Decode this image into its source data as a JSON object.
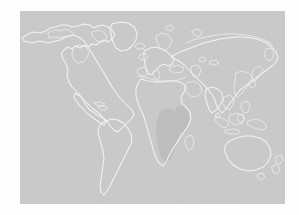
{
  "page": {
    "background_color": "#fdfdfd"
  },
  "figure": {
    "name": "world-map",
    "type": "world-map-graphic",
    "caption": "",
    "ocean_color": "#c9c9c9",
    "coastline_color": "#f2f2f2",
    "highlight_color": "#bdbdbd",
    "panel": {
      "left": 20,
      "top": 11,
      "width": 265,
      "height": 193
    },
    "projection": "equirectangular",
    "landmasses": [
      {
        "name": "north-america",
        "label": "North America"
      },
      {
        "name": "greenland",
        "label": "Greenland"
      },
      {
        "name": "south-america",
        "label": "South America"
      },
      {
        "name": "europe",
        "label": "Europe"
      },
      {
        "name": "africa",
        "label": "Africa"
      },
      {
        "name": "asia",
        "label": "Asia"
      },
      {
        "name": "southeast-asia-islands",
        "label": "Southeast Asia Islands"
      },
      {
        "name": "australia",
        "label": "Australia"
      },
      {
        "name": "new-zealand",
        "label": "New Zealand"
      },
      {
        "name": "japan",
        "label": "Japan"
      },
      {
        "name": "british-isles",
        "label": "British Isles"
      },
      {
        "name": "madagascar",
        "label": "Madagascar"
      },
      {
        "name": "iceland",
        "label": "Iceland"
      }
    ],
    "highlighted_regions": [
      {
        "name": "central-southern-africa",
        "label": "Central and Southern Africa",
        "shade": "#bdbdbd"
      }
    ]
  }
}
